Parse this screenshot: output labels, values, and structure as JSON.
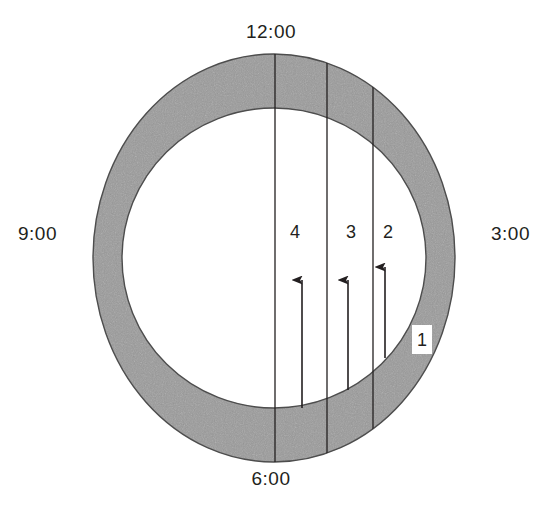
{
  "figure": {
    "type": "annular-clock-diagram",
    "background_color": "#ffffff",
    "ring_fill_color": "#999999",
    "ring_stroke_color": "#4d4d4d",
    "inner_fill_color": "#ffffff",
    "line_color": "#231f20",
    "text_color": "#231f20"
  },
  "clock_labels": {
    "top": "12:00",
    "right": "3:00",
    "bottom": "6:00",
    "left": "9:00"
  },
  "sector_labels": {
    "four": "4",
    "three": "3",
    "two": "2",
    "one": "1"
  },
  "geometry": {
    "center_x": 274,
    "center_y": 258,
    "outer_radius_x": 181,
    "outer_radius_y": 204,
    "inner_radius_x": 152,
    "inner_radius_y": 150
  },
  "chord_lines": [
    {
      "name": "chord-12-to-6",
      "x": 275
    },
    {
      "name": "chord-sector-3-4-divider",
      "x": 327
    },
    {
      "name": "chord-sector-2-3-divider",
      "x": 373
    }
  ],
  "arrows": [
    {
      "name": "arrow-sector-4",
      "x": 302,
      "tail_y": 408,
      "head_y": 268
    },
    {
      "name": "arrow-sector-3",
      "x": 348,
      "tail_y": 390,
      "head_y": 268
    },
    {
      "name": "arrow-sector-2",
      "x": 385,
      "tail_y": 358,
      "head_y": 255
    }
  ]
}
